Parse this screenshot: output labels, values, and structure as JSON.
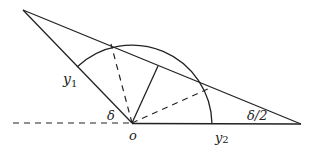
{
  "diagram": {
    "type": "geometry",
    "labels": {
      "y1": "y",
      "y1_sub": "1",
      "y2": "y",
      "y2_sub": "2",
      "delta": "δ",
      "delta_half": "δ/2",
      "origin": "o"
    },
    "points": {
      "apex": [
        23,
        10
      ],
      "o": [
        132,
        123
      ],
      "right_vertex": [
        301,
        124
      ],
      "arc_left_end": [
        77,
        67
      ],
      "arc_right_end": [
        212,
        124
      ],
      "upper_intersection": [
        111,
        44
      ],
      "perp_foot": [
        158,
        66
      ],
      "right_intersection": [
        210,
        88
      ]
    },
    "colors": {
      "stroke": "#222222",
      "background": "#ffffff"
    }
  }
}
